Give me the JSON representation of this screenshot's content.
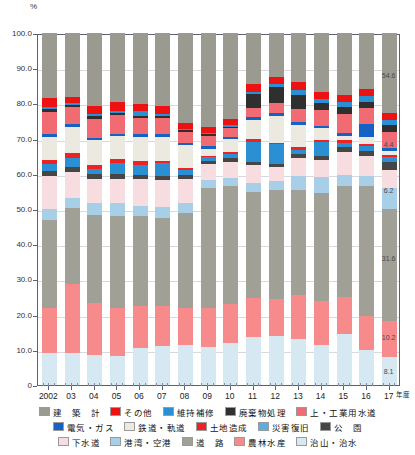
{
  "chart_data": {
    "type": "bar",
    "subtype": "stacked-percentage",
    "title": "",
    "unit": "%",
    "xlabel": "年度",
    "ylabel": "",
    "ylim": [
      0,
      100
    ],
    "yticks": [
      "0",
      "10.0",
      "20.0",
      "30.0",
      "40.0",
      "50.0",
      "60.0",
      "70.0",
      "80.0",
      "90.0",
      "100.0"
    ],
    "grid": true,
    "legend_position": "bottom",
    "categories": [
      "2002",
      "03",
      "04",
      "05",
      "06",
      "07",
      "08",
      "09",
      "10",
      "11",
      "12",
      "13",
      "14",
      "15",
      "16",
      "17"
    ],
    "series": [
      {
        "name": "治山・治水",
        "color": "#d6e8f2",
        "values": [
          9.0,
          9.2,
          8.6,
          8.2,
          10.5,
          11.0,
          11.5,
          10.8,
          12.0,
          13.5,
          14.0,
          13.0,
          11.5,
          14.5,
          10.0,
          8.1
        ]
      },
      {
        "name": "農林水産",
        "color": "#f78b8b",
        "values": [
          13.0,
          19.5,
          14.8,
          13.8,
          12.0,
          11.5,
          10.5,
          11.2,
          11.0,
          11.3,
          10.5,
          12.5,
          12.5,
          10.5,
          9.5,
          10.2
        ]
      },
      {
        "name": "道　路",
        "color": "#a0a096",
        "values": [
          25.0,
          21.5,
          25.0,
          26.0,
          25.5,
          25.0,
          27.0,
          34.0,
          33.5,
          30.0,
          31.0,
          30.0,
          30.5,
          31.5,
          37.0,
          31.6
        ]
      },
      {
        "name": "港湾・空港",
        "color": "#a8cfe8",
        "values": [
          3.0,
          2.8,
          3.2,
          3.6,
          3.0,
          3.0,
          2.6,
          2.3,
          2.2,
          2.5,
          2.4,
          4.0,
          4.5,
          3.2,
          3.0,
          6.2
        ]
      },
      {
        "name": "下水道",
        "color": "#f8dde0",
        "values": [
          9.5,
          7.5,
          7.0,
          7.0,
          7.5,
          7.8,
          7.0,
          4.5,
          4.8,
          5.2,
          4.0,
          5.0,
          5.0,
          6.5,
          5.5,
          5.0
        ]
      },
      {
        "name": "公　園",
        "color": "#464646",
        "values": [
          1.2,
          1.5,
          1.3,
          1.5,
          1.3,
          1.2,
          1.1,
          0.9,
          1.0,
          1.0,
          1.0,
          1.2,
          1.0,
          1.5,
          1.6,
          2.2
        ]
      },
      {
        "name": "災害復旧",
        "color": "#2b8fd4",
        "values": [
          2.0,
          2.5,
          1.6,
          3.0,
          2.6,
          3.5,
          1.5,
          1.0,
          1.2,
          5.5,
          5.5,
          1.2,
          4.0,
          1.0,
          1.2,
          1.5
        ]
      },
      {
        "name": "土地造成",
        "color": "#ee2222",
        "values": [
          1.2,
          1.4,
          1.0,
          1.2,
          1.2,
          0.6,
          0.6,
          0.5,
          0.6,
          0.8,
          0.5,
          0.6,
          0.5,
          0.8,
          0.8,
          0.6
        ]
      },
      {
        "name": "鉄道・軌道",
        "color": "#ece9e0",
        "values": [
          6.5,
          7.5,
          7.0,
          6.5,
          7.0,
          7.0,
          6.5,
          2.0,
          3.5,
          5.5,
          7.5,
          6.5,
          3.5,
          1.2,
          2.0,
          1.0
        ]
      },
      {
        "name": "電気・ガス",
        "color": "#1661c4",
        "values": [
          0.8,
          0.7,
          0.7,
          0.6,
          0.8,
          0.8,
          0.6,
          0.8,
          0.7,
          0.8,
          0.8,
          0.8,
          0.7,
          0.8,
          3.5,
          1.0
        ]
      },
      {
        "name": "上・工業用水道",
        "color": "#f06c72",
        "values": [
          6.5,
          5.0,
          5.5,
          5.2,
          4.5,
          4.5,
          3.0,
          2.8,
          2.4,
          2.6,
          3.0,
          3.5,
          4.5,
          5.5,
          4.5,
          4.4
        ]
      },
      {
        "name": "廃棄物処理",
        "color": "#2f2f2f",
        "values": [
          0.8,
          0.6,
          0.7,
          0.7,
          0.6,
          0.6,
          0.5,
          0.4,
          0.5,
          4.0,
          4.5,
          4.0,
          2.0,
          2.0,
          1.8,
          2.0
        ]
      },
      {
        "name": "維持補修",
        "color": "#2b8fd4",
        "values": [
          0.6,
          0.4,
          0.5,
          0.5,
          1.3,
          0.6,
          0.4,
          0.4,
          0.4,
          0.7,
          0.8,
          1.5,
          1.2,
          1.5,
          1.6,
          1.6
        ]
      },
      {
        "name": "その他",
        "color": "#ee1111",
        "values": [
          2.4,
          1.8,
          2.5,
          2.5,
          2.0,
          2.2,
          1.8,
          1.8,
          1.8,
          2.0,
          2.0,
          2.2,
          2.0,
          2.0,
          2.0,
          2.0
        ]
      },
      {
        "name": "建　築　計",
        "color": "#9a9a90",
        "values": [
          18.5,
          18.1,
          20.6,
          19.7,
          20.2,
          20.7,
          25.4,
          26.6,
          24.4,
          14.6,
          12.5,
          14.0,
          16.6,
          17.5,
          16.0,
          22.6
        ]
      }
    ],
    "value_labels_last_bar": [
      {
        "text": "54.6",
        "segment": "建　築　計",
        "y_pct": 88.0
      },
      {
        "text": "4.4",
        "segment": "上・工業用水道",
        "y_pct": 68.5
      },
      {
        "text": "6.2",
        "segment": "港湾・空港",
        "y_pct": 55.5
      },
      {
        "text": "31.6",
        "segment": "道　路",
        "y_pct": 36.0
      },
      {
        "text": "10.2",
        "segment": "農林水産",
        "y_pct": 13.5
      },
      {
        "text": "8.1",
        "segment": "治山・治水",
        "y_pct": 4.0
      }
    ]
  },
  "axis": {
    "unit_symbol": "%",
    "x_suffix": "年度"
  },
  "legend": {
    "rows": [
      [
        {
          "label": "建　築　計",
          "color": "#9a9a90"
        },
        {
          "label": "その他",
          "color": "#ee1111"
        },
        {
          "label": "維持補修",
          "color": "#2b8fd4"
        },
        {
          "label": "廃棄物処理",
          "color": "#2f2f2f"
        },
        {
          "label": "上・工業用水道",
          "color": "#f06c72"
        }
      ],
      [
        {
          "label": "電気・ガス",
          "color": "#1661c4"
        },
        {
          "label": "鉄道・軌道",
          "color": "#ece9e0"
        },
        {
          "label": "土地造成",
          "color": "#ee2222"
        },
        {
          "label": "災害復旧",
          "color": "#5aaee0"
        },
        {
          "label": "公　園",
          "color": "#464646"
        }
      ],
      [
        {
          "label": "下水道",
          "color": "#f8dde0"
        },
        {
          "label": "港湾・空港",
          "color": "#a8cfe8"
        },
        {
          "label": "道　路",
          "color": "#a0a096"
        },
        {
          "label": "農林水産",
          "color": "#f78b8b"
        },
        {
          "label": "治山・治水",
          "color": "#d6e8f2"
        }
      ]
    ]
  }
}
